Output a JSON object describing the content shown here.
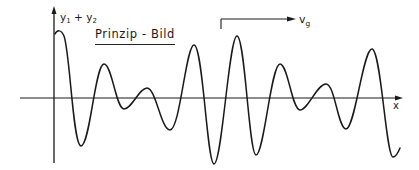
{
  "diagram": {
    "title": "Prinzip - Bild",
    "y_axis_label": {
      "base1": "y",
      "sub1": "1",
      "op": " + ",
      "base2": "y",
      "sub2": "2"
    },
    "x_axis_label": "x",
    "velocity_label": {
      "base": "v",
      "sub": "g"
    },
    "colors": {
      "line": "#1a1a1a",
      "background": "#ffffff"
    }
  }
}
